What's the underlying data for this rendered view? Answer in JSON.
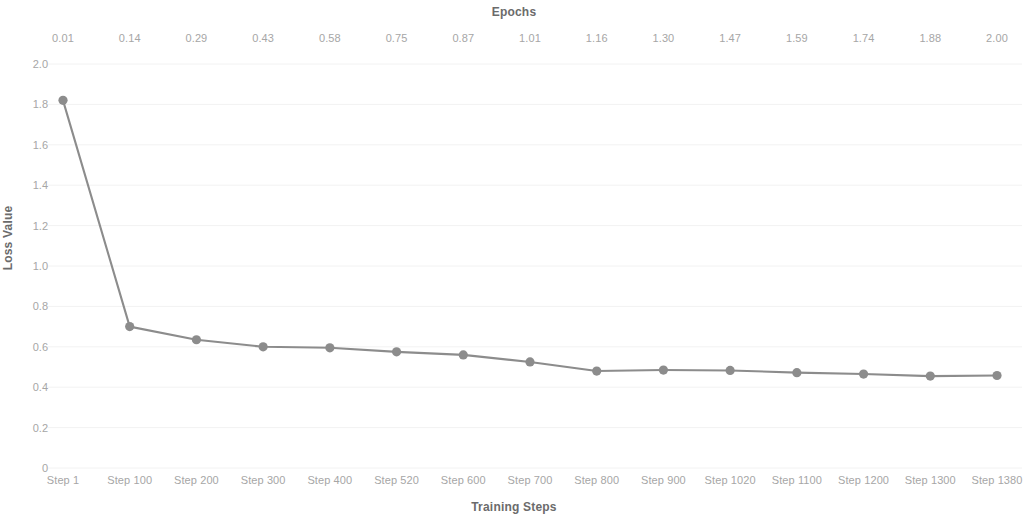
{
  "chart_data": {
    "type": "line",
    "title": "",
    "xlabel": "Training Steps",
    "ylabel": "Loss Value",
    "secondary_xlabel": "Epochs",
    "categories": [
      "Step 1",
      "Step 100",
      "Step 200",
      "Step 300",
      "Step 400",
      "Step 520",
      "Step 600",
      "Step 700",
      "Step 800",
      "Step 900",
      "Step 1020",
      "Step 1100",
      "Step 1200",
      "Step 1300",
      "Step 1380"
    ],
    "secondary_categories": [
      "0.01",
      "0.14",
      "0.29",
      "0.43",
      "0.58",
      "0.75",
      "0.87",
      "1.01",
      "1.16",
      "1.30",
      "1.47",
      "1.59",
      "1.74",
      "1.88",
      "2.00"
    ],
    "values": [
      1.82,
      0.7,
      0.635,
      0.6,
      0.595,
      0.575,
      0.56,
      0.525,
      0.48,
      0.485,
      0.483,
      0.472,
      0.465,
      0.455,
      0.458
    ],
    "ylim": [
      0,
      2.0
    ],
    "yticks": [
      "0",
      "0.2",
      "0.4",
      "0.6",
      "0.8",
      "1.0",
      "1.2",
      "1.4",
      "1.6",
      "1.8",
      "2.0"
    ],
    "ytick_values": [
      0,
      0.2,
      0.4,
      0.6,
      0.8,
      1.0,
      1.2,
      1.4,
      1.6,
      1.8,
      2.0
    ],
    "grid": true,
    "legend": "none",
    "series_color": "#8c8c8c",
    "grid_color": "#f2f2f2",
    "tick_color": "#a6a6a6",
    "title_color": "#6b6b6b"
  }
}
